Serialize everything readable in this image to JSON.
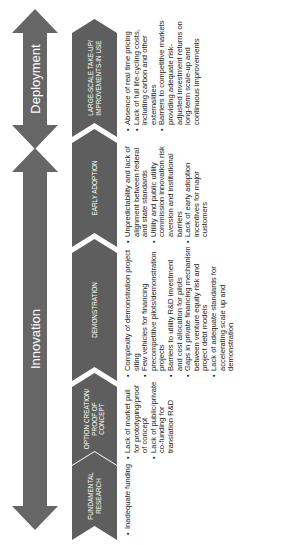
{
  "colors": {
    "arrow_fill": "#666666",
    "chevron_fill": "#5e5e5e",
    "label_text": "#ffffff",
    "body_text": "#222222",
    "background": "#ffffff"
  },
  "orientation": "rotated 90 degrees counter-clockwise",
  "phases": [
    {
      "name": "Innovation",
      "icon": "double-headed-arrow"
    },
    {
      "name": "Deployment",
      "icon": "double-headed-arrow"
    }
  ],
  "stages": [
    {
      "label": "FUNDAMENTAL RESEARCH",
      "barriers": [
        "Inadequate funding"
      ]
    },
    {
      "label": "OPTION CREATION/ PROOF OF CONCEPT",
      "barriers": [
        "Lack of market pull for prototyping/proof of concept",
        "Lack of public/private co-funding for translation R&D"
      ]
    },
    {
      "label": "DEMONSTRATION",
      "barriers": [
        "Complexity of demonstration project siting",
        "Few vehicles for financing precompetitive pilots/demonstration projects",
        "Barriers to utility R&D investment and cost allocation for pilots",
        "Gaps in private financing mechanism between venture equity risk and project debt models",
        "Lack of adequate standards for accelerating scale up and demonstration"
      ]
    },
    {
      "label": "EARLY ADOPTION",
      "barriers": [
        "Unpredictability and lack of alignment between federal and state standards",
        "Utility and public utility commission innovation risk aversion and institutional barriers",
        "Lack of early adoption incentives for major customers"
      ]
    },
    {
      "label": "LARGE-SCALE TAKE-UP/ IMPROVEMENTS-IN USE",
      "barriers": [
        "Absence of real time pricing",
        "Lack of full life-cycling costs, including carbon and other externalities",
        "Barriers to competitive markets providing adequate risk-adjusted investment returns on long-term scale-up and continuous improvements"
      ]
    }
  ]
}
